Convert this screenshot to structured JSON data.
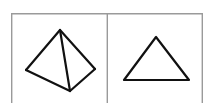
{
  "figure": {
    "background_color": "#ffffff",
    "width": 212,
    "height": 103,
    "frame": {
      "name": "outer-frame",
      "stroke_color": "#9a9a9a",
      "stroke_width": 1.4,
      "x": 11,
      "y": 13,
      "width": 192,
      "height": 96,
      "bottom_edge_visible": false
    },
    "divider": {
      "name": "panel-divider",
      "stroke_color": "#9a9a9a",
      "stroke_width": 1.4,
      "x": 107,
      "y_top": 13,
      "y_bottom": 103
    },
    "panels": [
      {
        "id": "left-panel",
        "label": "pyramid",
        "shape_name": "square-pyramid-wireframe",
        "shape_type": "3d-wireframe",
        "stroke_color": "#111111",
        "stroke_width": 2.2,
        "vertices": {
          "apex": [
            60,
            30
          ],
          "left": [
            26,
            70
          ],
          "right": [
            95,
            69
          ],
          "front": [
            70,
            91
          ]
        },
        "edges": [
          [
            "apex",
            "left"
          ],
          [
            "apex",
            "right"
          ],
          [
            "apex",
            "front"
          ],
          [
            "left",
            "front"
          ],
          [
            "front",
            "right"
          ]
        ],
        "edge_paths": [
          "M 60 30 L 26 70",
          "M 60 30 L 95 69",
          "M 60 30 L 70 91",
          "M 26 70 L 70 91",
          "M 70 91 L 95 69"
        ]
      },
      {
        "id": "right-panel",
        "label": "triangle",
        "shape_name": "equilateral-triangle",
        "shape_type": "2d-outline",
        "stroke_color": "#111111",
        "stroke_width": 2.2,
        "vertices": {
          "apex": [
            156,
            37
          ],
          "base_left": [
            124,
            80
          ],
          "base_right": [
            189,
            80
          ]
        },
        "edges": [
          [
            "apex",
            "base_left"
          ],
          [
            "base_left",
            "base_right"
          ],
          [
            "base_right",
            "apex"
          ]
        ],
        "edge_paths": [
          "M 156 37 L 124 80 L 189 80 Z"
        ]
      }
    ]
  }
}
